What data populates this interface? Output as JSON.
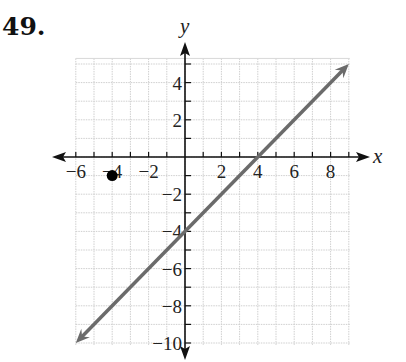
{
  "problem": {
    "number": "49."
  },
  "chart_data": {
    "type": "line",
    "title": "",
    "xlabel": "x",
    "ylabel": "y",
    "xlim": [
      -6,
      9
    ],
    "ylim": [
      -10,
      5.3
    ],
    "grid": true,
    "grid_step": 1,
    "x_tick_labels": [
      "-6",
      "-4",
      "-2",
      "2",
      "4",
      "6",
      "8"
    ],
    "x_tick_values": [
      -6,
      -4,
      -2,
      2,
      4,
      6,
      8
    ],
    "y_tick_labels": [
      "4",
      "2",
      "-2",
      "-4",
      "-6",
      "-8",
      "-10"
    ],
    "y_tick_values": [
      4,
      2,
      -2,
      -4,
      -6,
      -8,
      -10
    ],
    "series": [
      {
        "name": "line",
        "equation": "y = x - 4",
        "x": [
          -6,
          9
        ],
        "y": [
          -10,
          5
        ],
        "arrows": "both",
        "color": "#6b6b6b"
      }
    ],
    "points": [
      {
        "x": -4,
        "y": -1,
        "style": "filled-dot",
        "color": "#000000"
      }
    ],
    "legend": null
  }
}
